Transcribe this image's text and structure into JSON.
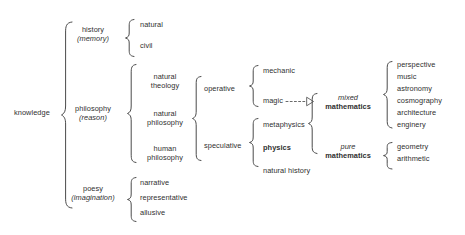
{
  "diagram": {
    "background": "#ffffff",
    "ink": "#2f2f2f",
    "root": {
      "label": "knowledge"
    },
    "level1": [
      {
        "label": "history",
        "qualifier": "(memory)"
      },
      {
        "label": "philosophy",
        "qualifier": "(reason)"
      },
      {
        "label": "poesy",
        "qualifier": "(imagination)"
      }
    ],
    "history_children": [
      {
        "label": "natural"
      },
      {
        "label": "civil"
      }
    ],
    "philosophy_children": [
      {
        "label": "natural",
        "sub": "theology"
      },
      {
        "label": "natural",
        "sub": "philosophy"
      },
      {
        "label": "human",
        "sub": "philosophy"
      }
    ],
    "poesy_children": [
      {
        "label": "narrative"
      },
      {
        "label": "representative"
      },
      {
        "label": "allusive"
      }
    ],
    "natural_philosophy_children": [
      {
        "label": "operative"
      },
      {
        "label": "speculative"
      }
    ],
    "operative_children": [
      {
        "label": "mechanic"
      },
      {
        "label": "magic"
      }
    ],
    "speculative_children": [
      {
        "label": "metaphysics"
      },
      {
        "label": "physics"
      },
      {
        "label": "natural history"
      }
    ],
    "mathematics": [
      {
        "italic": "mixed",
        "bold": "mathematics"
      },
      {
        "italic": "pure",
        "bold": "mathematics"
      }
    ],
    "mixed_mathematics_children": [
      {
        "label": "perspective"
      },
      {
        "label": "music"
      },
      {
        "label": "astronomy"
      },
      {
        "label": "cosmography"
      },
      {
        "label": "architecture"
      },
      {
        "label": "enginery"
      }
    ],
    "pure_mathematics_children": [
      {
        "label": "geometry"
      },
      {
        "label": "arithmetic"
      }
    ],
    "connector": {
      "type": "dashed-arrow",
      "from": "magic",
      "to": "mathematics-group"
    }
  }
}
